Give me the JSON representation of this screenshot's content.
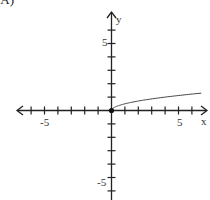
{
  "figure_label": "(A)",
  "chart_data": {
    "type": "line",
    "title": "",
    "xlabel": "x",
    "ylabel": "y",
    "xlim": [
      -7,
      7
    ],
    "ylim": [
      -7,
      7
    ],
    "x_tick_labels": [
      "-5",
      "5"
    ],
    "y_tick_labels": [
      "5",
      "-5"
    ],
    "grid": false,
    "series": [
      {
        "name": "y = (1/2)√x",
        "x": [
          0,
          0.25,
          0.5,
          1,
          2,
          3,
          4,
          5,
          6,
          6.7
        ],
        "y": [
          0,
          0.25,
          0.35,
          0.5,
          0.71,
          0.87,
          1.0,
          1.12,
          1.22,
          1.29
        ]
      }
    ],
    "start_point": {
      "x": 0,
      "y": 0,
      "style": "filled-dot"
    }
  },
  "axes": {
    "x_label": "x",
    "y_label": "y",
    "x_tick_neg5": "-5",
    "x_tick_pos5": "5",
    "y_tick_pos5": "5",
    "y_tick_neg5": "-5"
  }
}
